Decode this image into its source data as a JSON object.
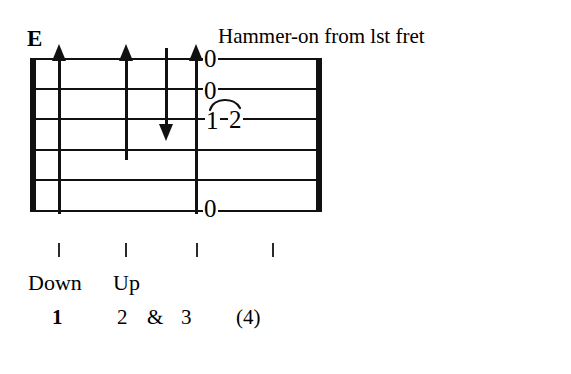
{
  "figure": {
    "type": "guitar-tablature",
    "chord_label": "E",
    "instruction": "Hammer-on from lst fret",
    "staff": {
      "string_count": 6,
      "string_names": [
        "E-high",
        "B",
        "G",
        "D",
        "A",
        "E-low"
      ],
      "left_bar": true,
      "right_bar": true
    },
    "fret_numbers": [
      {
        "value": "0",
        "string": 1,
        "beat": 3
      },
      {
        "value": "0",
        "string": 2,
        "beat": 3
      },
      {
        "value": "1",
        "string": 3,
        "beat": 3
      },
      {
        "value": "2",
        "string": 3,
        "beat": 3
      },
      {
        "value": "0",
        "string": 6,
        "beat": 3
      }
    ],
    "hammer_on": {
      "from": "1",
      "to": "2",
      "symbol": "slur-arc"
    },
    "strokes": [
      {
        "direction": "up",
        "beat": 1,
        "span": "full"
      },
      {
        "direction": "up",
        "beat": 2,
        "span": "partial-4"
      },
      {
        "direction": "down",
        "beat": "and",
        "span": "partial-3"
      },
      {
        "direction": "up",
        "beat": 3,
        "span": "full"
      }
    ],
    "beat_ticks": 4,
    "direction_words": [
      {
        "label": "Down",
        "beat": 1
      },
      {
        "label": "Up",
        "beat": 2
      }
    ],
    "counts": [
      {
        "label": "1",
        "accent": true
      },
      {
        "label": "2",
        "accent": false
      },
      {
        "label": "&",
        "accent": false
      },
      {
        "label": "3",
        "accent": false
      },
      {
        "label": "(4)",
        "accent": false
      }
    ]
  },
  "colors": {
    "ink": "#111111",
    "paper": "#ffffff",
    "tick": "#2a2a2a"
  }
}
